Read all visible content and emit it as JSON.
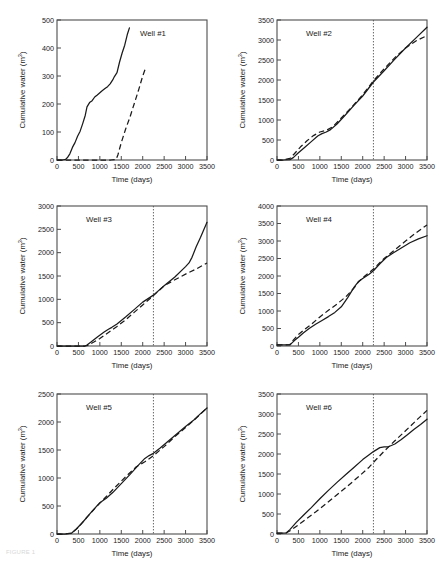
{
  "figure": {
    "caption": "FIGURE 1",
    "axis_titles": {
      "x": "Time (days)",
      "y": "Cumulative water (m³)"
    },
    "y_label_main": "Cumulative water (m",
    "y_label_sup": "3",
    "y_label_tail": ")",
    "legend": {
      "solid": "Observed",
      "dashed": "Simulated"
    }
  },
  "chart_data": [
    {
      "type": "line",
      "title": "Well #1",
      "xlabel": "Time (days)",
      "ylabel": "Cumulative water (m3)",
      "xlim": [
        0,
        3500
      ],
      "ylim": [
        0,
        500
      ],
      "xticks": [
        0,
        500,
        1000,
        1500,
        2000,
        2500,
        3000,
        3500
      ],
      "yticks": [
        0,
        100,
        200,
        300,
        400,
        500
      ],
      "grid": false,
      "legend_position": "none",
      "vline": null,
      "series": [
        {
          "name": "Observed",
          "style": "solid",
          "x": [
            0,
            120,
            200,
            250,
            300,
            360,
            420,
            480,
            540,
            600,
            660,
            700,
            760,
            820,
            880,
            940,
            1000,
            1060,
            1120,
            1180,
            1240,
            1300,
            1340,
            1400,
            1460,
            1520,
            1580,
            1640,
            1690
          ],
          "y": [
            0,
            0,
            2,
            10,
            22,
            45,
            62,
            85,
            103,
            130,
            160,
            190,
            205,
            212,
            225,
            232,
            240,
            248,
            255,
            262,
            272,
            286,
            298,
            312,
            350,
            382,
            410,
            448,
            472
          ]
        },
        {
          "name": "Simulated",
          "style": "dashed",
          "x": [
            0,
            200,
            400,
            700,
            1000,
            1250,
            1380,
            1420,
            1500,
            1600,
            1700,
            1800,
            1900,
            2000,
            2070
          ],
          "y": [
            0,
            0,
            0,
            0,
            0,
            0,
            2,
            18,
            62,
            110,
            152,
            200,
            248,
            300,
            330
          ]
        }
      ]
    },
    {
      "type": "line",
      "title": "Well #2",
      "xlabel": "Time (days)",
      "ylabel": "Cumulative water (m3)",
      "xlim": [
        0,
        3500
      ],
      "ylim": [
        0,
        3500
      ],
      "xticks": [
        0,
        500,
        1000,
        1500,
        2000,
        2500,
        3000,
        3500
      ],
      "yticks": [
        0,
        500,
        1000,
        1500,
        2000,
        2500,
        3000,
        3500
      ],
      "grid": false,
      "legend_position": "none",
      "vline": 2250,
      "series": [
        {
          "name": "Observed",
          "style": "solid",
          "x": [
            0,
            150,
            300,
            380,
            500,
            650,
            800,
            950,
            1050,
            1150,
            1250,
            1400,
            1600,
            1800,
            2000,
            2250,
            2500,
            2750,
            3000,
            3250,
            3500
          ],
          "y": [
            0,
            0,
            10,
            60,
            180,
            320,
            460,
            600,
            660,
            700,
            760,
            900,
            1130,
            1370,
            1600,
            1950,
            2230,
            2520,
            2800,
            3060,
            3320
          ]
        },
        {
          "name": "Simulated",
          "style": "dashed",
          "x": [
            0,
            150,
            300,
            400,
            550,
            700,
            850,
            1000,
            1150,
            1300,
            1500,
            1750,
            2000,
            2250,
            2500,
            2750,
            3000,
            3250,
            3500
          ],
          "y": [
            0,
            0,
            40,
            150,
            330,
            480,
            610,
            700,
            740,
            830,
            1050,
            1330,
            1630,
            1980,
            2280,
            2560,
            2800,
            2980,
            3110
          ]
        }
      ]
    },
    {
      "type": "line",
      "title": "Well #3",
      "xlabel": "Time (days)",
      "ylabel": "Cumulative water (m3)",
      "xlim": [
        0,
        3500
      ],
      "ylim": [
        0,
        3000
      ],
      "xticks": [
        0,
        500,
        1000,
        1500,
        2000,
        2500,
        3000,
        3500
      ],
      "yticks": [
        0,
        500,
        1000,
        1500,
        2000,
        2500,
        3000
      ],
      "grid": false,
      "legend_position": "none",
      "vline": 2250,
      "series": [
        {
          "name": "Observed",
          "style": "solid",
          "x": [
            0,
            400,
            650,
            700,
            800,
            950,
            1100,
            1200,
            1280,
            1400,
            1600,
            1800,
            2000,
            2250,
            2500,
            2750,
            3000,
            3080,
            3150,
            3250,
            3350,
            3500
          ],
          "y": [
            0,
            0,
            0,
            20,
            90,
            200,
            300,
            360,
            400,
            470,
            620,
            780,
            940,
            1090,
            1290,
            1480,
            1700,
            1780,
            1900,
            2130,
            2330,
            2650
          ]
        },
        {
          "name": "Simulated",
          "style": "dashed",
          "x": [
            0,
            400,
            650,
            720,
            850,
            1000,
            1200,
            1400,
            1600,
            1800,
            2000,
            2250,
            2500,
            2750,
            3000,
            3250,
            3500
          ],
          "y": [
            0,
            0,
            0,
            15,
            80,
            160,
            290,
            420,
            560,
            720,
            880,
            1080,
            1290,
            1420,
            1540,
            1650,
            1780
          ]
        }
      ]
    },
    {
      "type": "line",
      "title": "Well #4",
      "xlabel": "Time (days)",
      "ylabel": "Cumulative water (m3)",
      "xlim": [
        0,
        3500
      ],
      "ylim": [
        0,
        4000
      ],
      "xticks": [
        0,
        500,
        1000,
        1500,
        2000,
        2500,
        3000,
        3500
      ],
      "yticks": [
        0,
        500,
        1000,
        1500,
        2000,
        2500,
        3000,
        3500,
        4000
      ],
      "grid": false,
      "legend_position": "none",
      "vline": 2250,
      "series": [
        {
          "name": "Observed",
          "style": "solid",
          "x": [
            0,
            150,
            300,
            350,
            420,
            500,
            620,
            750,
            900,
            1050,
            1200,
            1350,
            1500,
            1650,
            1800,
            1900,
            2000,
            2150,
            2250,
            2400,
            2550,
            2700,
            2900,
            3100,
            3300,
            3500
          ],
          "y": [
            30,
            30,
            30,
            90,
            170,
            250,
            380,
            500,
            620,
            730,
            840,
            960,
            1120,
            1380,
            1680,
            1840,
            1930,
            2050,
            2150,
            2350,
            2530,
            2650,
            2800,
            2950,
            3060,
            3150
          ]
        },
        {
          "name": "Simulated",
          "style": "dashed",
          "x": [
            0,
            150,
            300,
            380,
            500,
            650,
            800,
            1000,
            1200,
            1400,
            1600,
            1800,
            1900,
            2050,
            2250,
            2500,
            2750,
            3000,
            3250,
            3500
          ],
          "y": [
            30,
            30,
            40,
            170,
            330,
            480,
            620,
            830,
            1020,
            1200,
            1400,
            1660,
            1830,
            2000,
            2200,
            2500,
            2750,
            3000,
            3240,
            3460
          ]
        }
      ]
    },
    {
      "type": "line",
      "title": "Well #5",
      "xlabel": "Time (days)",
      "ylabel": "Cumulative water (m3)",
      "xlim": [
        0,
        3500
      ],
      "ylim": [
        0,
        2500
      ],
      "xticks": [
        0,
        500,
        1000,
        1500,
        2000,
        2500,
        3000,
        3500
      ],
      "yticks": [
        0,
        500,
        1000,
        1500,
        2000,
        2500
      ],
      "grid": false,
      "legend_position": "none",
      "vline": 2250,
      "series": [
        {
          "name": "Observed",
          "style": "solid",
          "x": [
            0,
            200,
            330,
            450,
            600,
            800,
            1000,
            1150,
            1300,
            1500,
            1700,
            1900,
            2050,
            2150,
            2250,
            2400,
            2600,
            2800,
            3000,
            3200,
            3350,
            3500
          ],
          "y": [
            0,
            0,
            10,
            90,
            210,
            390,
            560,
            640,
            740,
            900,
            1060,
            1230,
            1350,
            1400,
            1440,
            1530,
            1660,
            1790,
            1920,
            2040,
            2150,
            2250
          ]
        },
        {
          "name": "Simulated",
          "style": "dashed",
          "x": [
            0,
            200,
            350,
            500,
            700,
            900,
            1100,
            1350,
            1600,
            1850,
            2050,
            2250,
            2500,
            2750,
            3000,
            3250,
            3500
          ],
          "y": [
            0,
            0,
            20,
            120,
            300,
            470,
            630,
            830,
            1020,
            1200,
            1290,
            1400,
            1560,
            1740,
            1900,
            2070,
            2250
          ]
        }
      ]
    },
    {
      "type": "line",
      "title": "Well #6",
      "xlabel": "Time (days)",
      "ylabel": "Cumulative water (m3)",
      "xlim": [
        0,
        3500
      ],
      "ylim": [
        0,
        3500
      ],
      "xticks": [
        0,
        500,
        1000,
        1500,
        2000,
        2500,
        3000,
        3500
      ],
      "yticks": [
        0,
        500,
        1000,
        1500,
        2000,
        2500,
        3000,
        3500
      ],
      "grid": false,
      "legend_position": "none",
      "vline": 2250,
      "series": [
        {
          "name": "Observed",
          "style": "solid",
          "x": [
            0,
            120,
            220,
            300,
            450,
            600,
            800,
            1000,
            1200,
            1400,
            1600,
            1800,
            2000,
            2150,
            2250,
            2400,
            2500,
            2600,
            2750,
            2900,
            3050,
            3200,
            3350,
            3500
          ],
          "y": [
            20,
            20,
            30,
            110,
            290,
            450,
            660,
            880,
            1090,
            1290,
            1480,
            1670,
            1860,
            1980,
            2060,
            2160,
            2180,
            2180,
            2250,
            2360,
            2490,
            2620,
            2740,
            2870
          ]
        },
        {
          "name": "Simulated",
          "style": "dashed",
          "x": [
            0,
            120,
            220,
            320,
            500,
            700,
            900,
            1150,
            1400,
            1650,
            1900,
            2150,
            2250,
            2500,
            2750,
            3000,
            3250,
            3500
          ],
          "y": [
            20,
            20,
            30,
            90,
            230,
            390,
            550,
            760,
            980,
            1200,
            1430,
            1670,
            1790,
            2070,
            2330,
            2580,
            2840,
            3090
          ]
        }
      ]
    }
  ]
}
